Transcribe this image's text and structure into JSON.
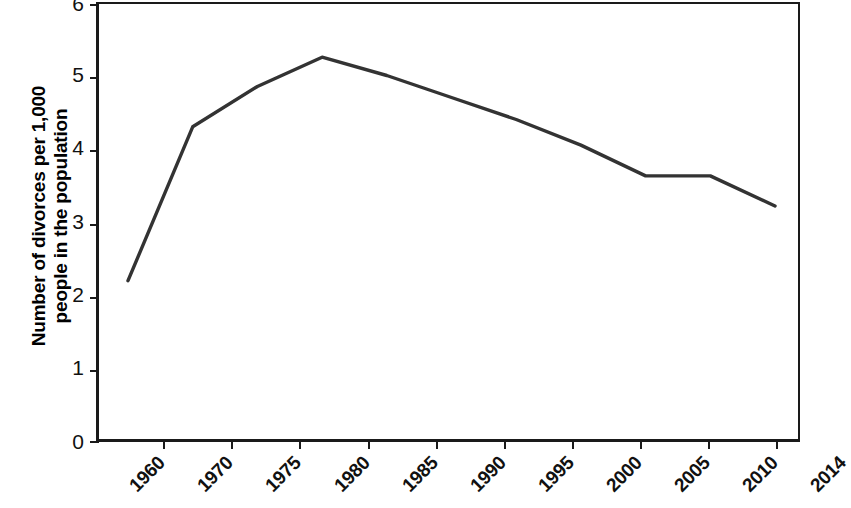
{
  "chart_data": {
    "type": "line",
    "title": "",
    "subtitle": "",
    "xlabel": "",
    "ylabel": "Number of divorces per 1,000 people in the population",
    "ylabel_lines": [
      "Number of divorces per 1,000",
      "people in the population"
    ],
    "categories": [
      "1960",
      "1970",
      "1975",
      "1980",
      "1985",
      "1990",
      "1995",
      "2000",
      "2005",
      "2010",
      "2014"
    ],
    "xticklabels": [
      "1960",
      "1970",
      "1975",
      "1980",
      "1985",
      "1990",
      "1995",
      "2000",
      "2005",
      "2010",
      "2014"
    ],
    "yticklabels": [
      "0",
      "1",
      "2",
      "3",
      "4",
      "5",
      "6"
    ],
    "yticks": [
      0,
      1,
      2,
      3,
      4,
      5,
      6
    ],
    "ylim": [
      0,
      6
    ],
    "values": [
      2.2,
      4.3,
      4.85,
      5.25,
      5.0,
      4.7,
      4.4,
      4.05,
      3.63,
      3.63,
      3.22
    ],
    "series": [
      {
        "name": "Divorce rate",
        "values": [
          2.2,
          4.3,
          4.85,
          5.25,
          5.0,
          4.7,
          4.4,
          4.05,
          3.63,
          3.63,
          3.22
        ],
        "color": "#333333"
      }
    ],
    "grid": false,
    "legend": false,
    "legend_position": "none",
    "line_color": "#333333",
    "line_width": 3,
    "markers": false,
    "annotations": []
  },
  "axes": {
    "y_title_line1": "Number of divorces per 1,000",
    "y_title_line2": "people in the population",
    "y_labels": [
      "6",
      "5",
      "4",
      "3",
      "2",
      "1",
      "0"
    ],
    "x_labels": [
      "1960",
      "1970",
      "1975",
      "1980",
      "1985",
      "1990",
      "1995",
      "2000",
      "2005",
      "2010",
      "2014"
    ]
  },
  "colors": {
    "line": "#333333",
    "axis": "#1a1a1a",
    "text": "#111111",
    "background": "#ffffff"
  }
}
